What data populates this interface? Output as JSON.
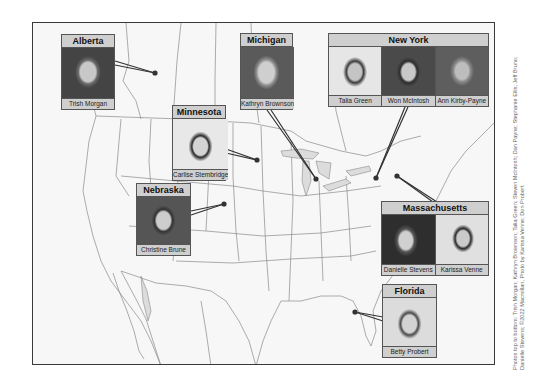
{
  "map": {
    "region": "North America (Canada, United States, Mexico)",
    "colors": {
      "background": "#ffffff",
      "land": "#f7f7f7",
      "water": "#dcdcdc",
      "borders": "#8a8a8a",
      "frame": "#3a3a3a",
      "label_fill": "#cfcfcf",
      "dot": "#333333"
    }
  },
  "locations": [
    {
      "id": "alberta",
      "label": "Alberta",
      "people": [
        "Trish Morgan"
      ],
      "dot": [
        154,
        72
      ]
    },
    {
      "id": "michigan",
      "label": "Michigan",
      "people": [
        "Kathryn Brownson"
      ],
      "dot": [
        315,
        178
      ]
    },
    {
      "id": "new-york",
      "label": "New York",
      "people": [
        "Talia Green",
        "Won McIntosh",
        "Ann Kirby-Payne"
      ],
      "dot": [
        375,
        177
      ]
    },
    {
      "id": "minnesota",
      "label": "Minnesota",
      "people": [
        "Carlise Stembridge"
      ],
      "dot": [
        256,
        159
      ]
    },
    {
      "id": "nebraska",
      "label": "Nebraska",
      "people": [
        "Christine Brune"
      ],
      "dot": [
        223,
        203
      ]
    },
    {
      "id": "massachusetts",
      "label": "Massachusetts",
      "people": [
        "Danielle Stevens",
        "Karissa Venne"
      ],
      "dot": [
        396,
        175
      ]
    },
    {
      "id": "florida",
      "label": "Florida",
      "people": [
        "Betty Probert"
      ],
      "dot": [
        354,
        311
      ]
    }
  ],
  "credit": {
    "line1": "Photos top to bottom: Trish Morgan; Kathryn Brownson; Talia Green; Steven McIntosh; Dan Payne; Stephanie Ellis; Jeff Bruno;",
    "line2": "Danielle Stevens; ©2022 Macmillan, Photo by Karissa Venne; Don Probert"
  }
}
